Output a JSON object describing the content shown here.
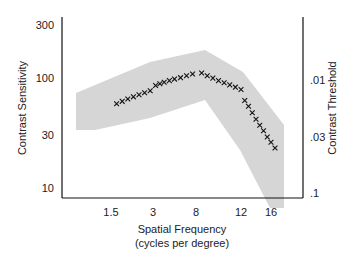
{
  "chart_data": {
    "type": "line",
    "title": "",
    "xlabel": "Spatial Frequency",
    "xlabel_sub": "(cycles per degree)",
    "ylabel": "Contrast Sensitivity",
    "ylabel_right": "Contrast Threshold",
    "x_ticks": [
      "1.5",
      "3",
      "8",
      "12",
      "16"
    ],
    "y_ticks": [
      "300",
      "100",
      "30",
      "10"
    ],
    "y_right_ticks": [
      ".01",
      ".03",
      ".1"
    ],
    "yscale": "log",
    "ylim": [
      10,
      300
    ],
    "grid": false,
    "legend": null,
    "band_color": "#d6d6d6",
    "marker": "x",
    "series": [
      {
        "name": "sensitivity",
        "segments": [
          {
            "x": [
              1.7,
              1.9,
              2.1,
              2.3,
              2.5,
              2.7,
              2.9
            ],
            "y": [
              58,
              61,
              64,
              67,
              70,
              73,
              76
            ]
          },
          {
            "x": [
              3.3,
              3.8,
              4.3,
              4.9,
              5.5,
              6.2,
              6.9,
              7.6
            ],
            "y": [
              85,
              88,
              91,
              94,
              97,
              100,
              104,
              108
            ]
          },
          {
            "x": [
              8.5,
              9.0,
              9.5,
              10.0,
              10.5,
              11.0,
              11.5,
              12.0
            ],
            "y": [
              110,
              104,
              99,
              94,
              90,
              86,
              82,
              78
            ]
          },
          {
            "x": [
              12.5,
              13.0,
              13.5,
              14.0,
              14.5,
              15.0,
              15.5,
              16.0,
              16.5
            ],
            "y": [
              62,
              55,
              48,
              42,
              37,
              33,
              29,
              26,
              23
            ]
          }
        ]
      }
    ]
  }
}
